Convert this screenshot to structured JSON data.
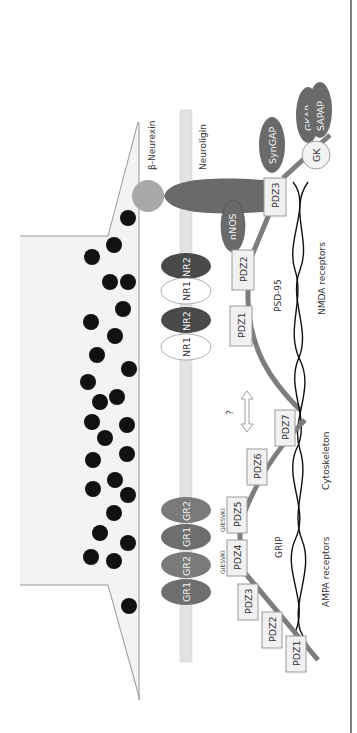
{
  "diagram": {
    "orientation": "rotated-90-ccw",
    "colors": {
      "background": "#ffffff",
      "presynaptic_fill": "#f3f3f3",
      "membrane": "#e2e2e2",
      "vesicle": "#111111",
      "dark_protein": "#5a5a5a",
      "mid_protein": "#7a7a7a",
      "light_protein": "#a8a8a8",
      "scaffold_line": "#7d7d7d",
      "cytoskeleton": "#111111",
      "frame_border": "#555555"
    },
    "presynaptic": {
      "label": "β-Neurexin"
    },
    "postsynaptic": {
      "neuroligin_label": "Neuroligin",
      "nmda_receptor": {
        "label": "NMDA receptors",
        "subunits": [
          "NR1",
          "NR2",
          "NR1",
          "NR2"
        ]
      },
      "ampa_receptor": {
        "label": "AMPA receptors",
        "subunits": [
          "GR1",
          "GR2",
          "GR1",
          "GR2"
        ]
      },
      "psd95": {
        "label": "PSD-95",
        "domains": [
          "PDZ1",
          "PDZ2",
          "PDZ3"
        ],
        "partners": [
          "nNOS",
          "SynGAP",
          "GK",
          "GKAP",
          "SAPAP"
        ]
      },
      "grip": {
        "label": "GRIP",
        "domains": [
          "PDZ1",
          "PDZ2",
          "PDZ3",
          "PDZ4",
          "PDZ5",
          "PDZ6",
          "PDZ7"
        ],
        "motif_labels": [
          "GIESVKI",
          "GIESVKI"
        ]
      },
      "cytoskeleton_label": "Cytoskeleton",
      "interaction_question": "?"
    }
  }
}
